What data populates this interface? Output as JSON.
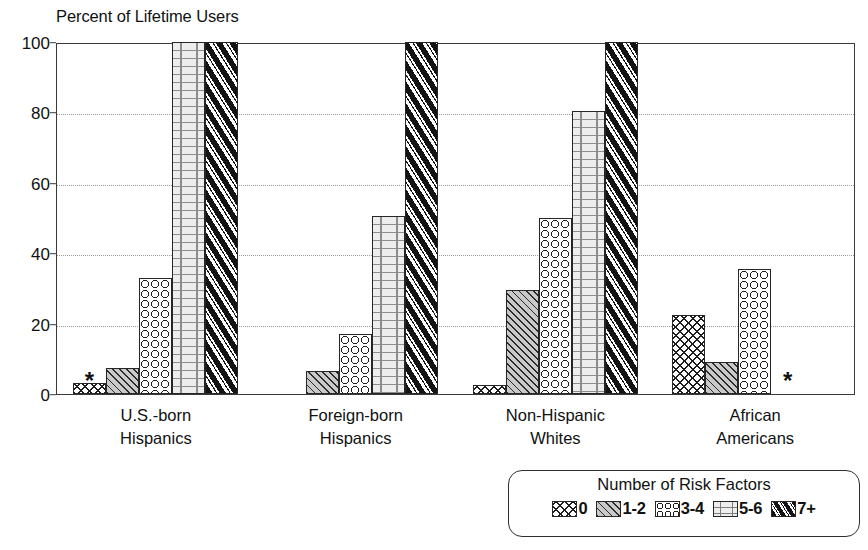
{
  "chart_data": {
    "type": "bar",
    "title": "Percent of Lifetime Users",
    "xlabel": "",
    "ylabel": "Percent of Lifetime Users",
    "ylim": [
      0,
      100
    ],
    "yticks": [
      0,
      20,
      40,
      60,
      80,
      100
    ],
    "ytick_labels": [
      "0",
      "20",
      "40",
      "60",
      "80",
      "100"
    ],
    "grid": true,
    "grid_axis": "y",
    "legend_title": "Number of Risk Factors",
    "legend_position": "bottom-right",
    "categories": [
      "U.S.-born Hispanics",
      "Foreign-born Hispanics",
      "Non-Hispanic Whites",
      "African Americans"
    ],
    "category_lines": [
      [
        "U.S.-born",
        "Hispanics"
      ],
      [
        "Foreign-born",
        "Hispanics"
      ],
      [
        "Non-Hispanic",
        "Whites"
      ],
      [
        "African",
        "Americans"
      ]
    ],
    "series": [
      {
        "name": "0",
        "pattern": "cross-hatch",
        "values": [
          3,
          null,
          2.5,
          22.5
        ]
      },
      {
        "name": "1-2",
        "pattern": "diagonal-hatch",
        "values": [
          7.5,
          6.5,
          29.5,
          9
        ]
      },
      {
        "name": "3-4",
        "pattern": "open-circles",
        "values": [
          33,
          17,
          50,
          35.5
        ]
      },
      {
        "name": "5-6",
        "pattern": "brick",
        "values": [
          100,
          50.5,
          80.5,
          null
        ]
      },
      {
        "name": "7+",
        "pattern": "black-diagonal",
        "values": [
          100,
          100,
          100,
          null
        ]
      }
    ],
    "suppressed_marker": "*",
    "suppressed_cells": [
      {
        "group": 0,
        "series": 0
      },
      {
        "group": 3,
        "series": 3
      }
    ]
  },
  "colors": {
    "axis": "#3a3a3a",
    "grid": "#9a9a9a",
    "bar_outline": "#262626",
    "text": "#111111",
    "background": "#ffffff"
  }
}
